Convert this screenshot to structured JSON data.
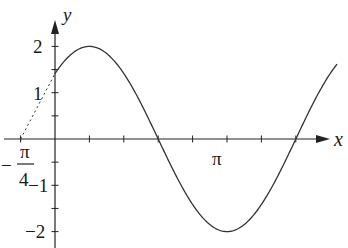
{
  "chart_data": {
    "type": "line",
    "title": "",
    "function": "y = 2 sin(x + π/4)",
    "xlabel": "x",
    "ylabel": "y",
    "amplitude": 2,
    "phase_shift": 0.7853981634,
    "x_range_rad": [
      0,
      6.44
    ],
    "tangent_extension": {
      "from": [
        -0.7853981634,
        0
      ],
      "to": [
        0,
        1.4142
      ],
      "style": "dashed"
    },
    "x_ticks_step": "π/4",
    "x_tick_labels": [
      {
        "value": -0.7853981634,
        "label_num": "π",
        "label_den": "4",
        "label_sign": "−"
      },
      {
        "value": 3.14159265,
        "label": "π"
      }
    ],
    "y_tick_labels": [
      {
        "value": 2,
        "label": "2"
      },
      {
        "value": 1,
        "label": "1"
      },
      {
        "value": -1,
        "label": "−1"
      },
      {
        "value": -2,
        "label": "−2"
      }
    ],
    "ylim": [
      -2,
      2
    ],
    "grid": false,
    "points": [
      {
        "x": 0,
        "y": 1.414
      },
      {
        "x": 0.785,
        "y": 2
      },
      {
        "x": 2.356,
        "y": 0
      },
      {
        "x": 3.927,
        "y": -2
      },
      {
        "x": 5.498,
        "y": 0
      }
    ]
  },
  "labels": {
    "x_axis": "x",
    "y_axis": "y",
    "pi": "π",
    "neg_sign": "−",
    "pi_over": "π",
    "four": "4",
    "y2": "2",
    "y1": "1",
    "yneg1": "−1",
    "yneg2": "−2"
  }
}
